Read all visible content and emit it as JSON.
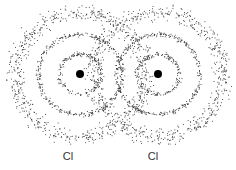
{
  "diagram": {
    "title": "",
    "atoms": [
      {
        "label": "Cl",
        "nucleus_x": 80,
        "nucleus_y": 74,
        "label_x": 68
      },
      {
        "label": "Cl",
        "nucleus_x": 158,
        "nucleus_y": 74,
        "label_x": 153
      }
    ],
    "shells": [
      {
        "radius": 20,
        "density": "high"
      },
      {
        "radius": 40,
        "density": "high"
      },
      {
        "radius": 62,
        "density": "low"
      }
    ],
    "colors": {
      "dots": "#333333",
      "nucleus": "#000000",
      "background": "#ffffff"
    }
  }
}
